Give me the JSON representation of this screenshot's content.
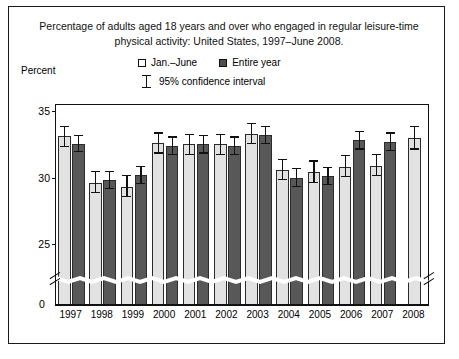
{
  "figure": {
    "title_line1": "Percentage of adults aged 18 years and over who engaged in regular leisure-time",
    "title_line2": "physical activity: United States, 1997–June 2008.",
    "percent_label": "Percent",
    "zero_label": "0"
  },
  "legend": {
    "jan_june": "Jan.–June",
    "entire_year": "Entire year",
    "ci": "95% confidence interval",
    "light_swatch_color": "#ffffff",
    "dark_swatch_color": "#4f4f4f"
  },
  "chart_data": {
    "type": "bar",
    "title": "Percentage of adults aged 18 years and over who engaged in regular leisure-time physical activity: United States, 1997–June 2008.",
    "xlabel": "",
    "ylabel": "Percent",
    "ylim": [
      25,
      35
    ],
    "yticks": [
      25,
      30,
      35
    ],
    "axis_break": true,
    "axis_break_note": "y-axis broken between 0 and 25",
    "grid": false,
    "legend_position": "top",
    "categories": [
      "1997",
      "1998",
      "1999",
      "2000",
      "2001",
      "2002",
      "2003",
      "2004",
      "2005",
      "2006",
      "2007",
      "2008"
    ],
    "series": [
      {
        "name": "Jan.–June",
        "color": "#e2e2e2",
        "values": [
          33.1,
          29.6,
          29.3,
          32.6,
          32.5,
          32.5,
          33.3,
          30.6,
          30.4,
          30.8,
          30.9,
          33.0
        ],
        "ci_low": [
          32.3,
          28.8,
          28.5,
          31.8,
          31.7,
          31.7,
          32.5,
          29.8,
          29.6,
          30.0,
          30.1,
          32.1
        ],
        "ci_high": [
          33.9,
          30.5,
          30.2,
          33.4,
          33.3,
          33.3,
          34.1,
          31.4,
          31.3,
          31.7,
          31.8,
          33.9
        ]
      },
      {
        "name": "Entire year",
        "color": "#585858",
        "values": [
          32.5,
          29.8,
          30.2,
          32.4,
          32.5,
          32.4,
          33.2,
          30.0,
          30.1,
          32.8,
          32.7,
          null
        ],
        "ci_low": [
          31.9,
          29.1,
          29.5,
          31.7,
          31.8,
          31.7,
          32.5,
          29.3,
          29.4,
          32.1,
          32.0,
          null
        ],
        "ci_high": [
          33.2,
          30.5,
          30.9,
          33.1,
          33.2,
          33.1,
          33.9,
          30.7,
          30.8,
          33.5,
          33.4,
          null
        ]
      }
    ]
  }
}
